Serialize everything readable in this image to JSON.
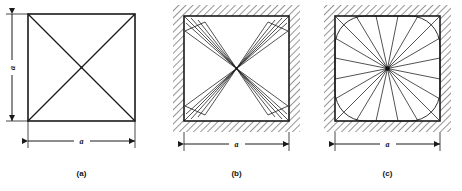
{
  "figure": {
    "background_color": "#ffffff",
    "line_color": "#1a1a1a",
    "hatch_color": "#3c3c3c",
    "panels": [
      {
        "id": "a",
        "caption": "(a)",
        "dimensions": [
          {
            "orientation": "vertical",
            "label": "a"
          },
          {
            "orientation": "horizontal",
            "label": "a"
          }
        ],
        "shape": "square",
        "hatched_border": false,
        "interior": "two-full-diagonals",
        "line_count": 2
      },
      {
        "id": "b",
        "caption": "(b)",
        "dimensions": [
          {
            "orientation": "horizontal",
            "label": "a"
          }
        ],
        "shape": "square",
        "hatched_border": true,
        "interior": "corner-fan-bowtie",
        "line_count": 24
      },
      {
        "id": "c",
        "caption": "(c)",
        "dimensions": [
          {
            "orientation": "horizontal",
            "label": "a"
          }
        ],
        "shape": "rounded-square",
        "hatched_border": true,
        "interior": "radial-fan",
        "line_count": 20
      }
    ]
  }
}
